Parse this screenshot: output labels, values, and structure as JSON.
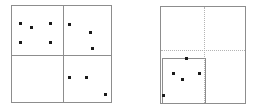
{
  "figure": {
    "title": "",
    "background_color": "#ffffff",
    "width": 256,
    "height": 110,
    "frame_color": "#8d8d8d",
    "dotted_color": "#b4b4b4",
    "point_color": "#1a1a1a",
    "point_size": 3
  },
  "panels": [
    {
      "id": "left-panel",
      "name": "quadrant-partition-panel",
      "label": "",
      "box": {
        "x": 11,
        "y": 5,
        "width": 101,
        "height": 98
      },
      "dividers": [
        {
          "name": "vertical-divider",
          "orientation": "vertical",
          "style": "solid",
          "position": 51
        },
        {
          "name": "horizontal-divider",
          "orientation": "horizontal",
          "style": "solid",
          "position": 49
        }
      ],
      "subregions": [],
      "points": [
        {
          "x": 8,
          "y": 17
        },
        {
          "x": 19,
          "y": 21
        },
        {
          "x": 38,
          "y": 17
        },
        {
          "x": 8,
          "y": 36
        },
        {
          "x": 38,
          "y": 36
        },
        {
          "x": 57,
          "y": 18
        },
        {
          "x": 78,
          "y": 26
        },
        {
          "x": 80,
          "y": 42
        },
        {
          "x": 57,
          "y": 71
        },
        {
          "x": 74,
          "y": 71
        },
        {
          "x": 93,
          "y": 88
        }
      ],
      "quadrant_counts": {
        "top_left": 5,
        "top_right": 3,
        "bottom_left": 0,
        "bottom_right": 3
      }
    },
    {
      "id": "right-panel",
      "name": "recursive-subdivision-panel",
      "label": "",
      "box": {
        "x": 160,
        "y": 6,
        "width": 86,
        "height": 98
      },
      "dividers": [
        {
          "name": "vertical-guide",
          "orientation": "vertical",
          "style": "dotted",
          "position": 43
        },
        {
          "name": "horizontal-guide",
          "orientation": "horizontal",
          "style": "dotted",
          "position": 43
        }
      ],
      "subregions": [
        {
          "name": "lower-left-cell",
          "x": 1,
          "y": 51,
          "width": 44,
          "height": 46,
          "style": "solid"
        }
      ],
      "points": [
        {
          "x": 25,
          "y": 51
        },
        {
          "x": 12,
          "y": 66
        },
        {
          "x": 21,
          "y": 72
        },
        {
          "x": 38,
          "y": 66
        },
        {
          "x": 2,
          "y": 88
        }
      ],
      "quadrant_counts": {
        "top_left": 0,
        "top_right": 0,
        "bottom_left": 5,
        "bottom_right": 0
      }
    }
  ],
  "chart_data": {
    "type": "scatter",
    "title": "",
    "xlabel": "",
    "ylabel": "",
    "series": [
      {
        "name": "left-panel-points",
        "count": 11,
        "x": [
          8,
          19,
          38,
          8,
          38,
          57,
          78,
          80,
          57,
          74,
          93
        ],
        "y": [
          17,
          21,
          17,
          36,
          36,
          18,
          26,
          42,
          71,
          71,
          88
        ]
      },
      {
        "name": "right-panel-points",
        "count": 5,
        "x": [
          25,
          12,
          21,
          38,
          2
        ],
        "y": [
          51,
          66,
          72,
          66,
          88
        ]
      }
    ],
    "xlim": [
      0,
      101
    ],
    "ylim": [
      0,
      98
    ],
    "grid": false,
    "legend": "none"
  }
}
